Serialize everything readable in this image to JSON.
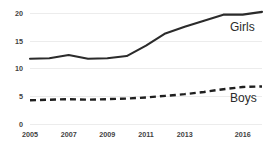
{
  "chart_data": {
    "type": "line",
    "title": "",
    "subtitle": "",
    "xlabel": "",
    "ylabel": "",
    "x": [
      2005,
      2006,
      2007,
      2008,
      2009,
      2010,
      2011,
      2012,
      2013,
      2014,
      2015,
      2016,
      2017
    ],
    "xlim": [
      2005,
      2017
    ],
    "ylim": [
      0,
      21
    ],
    "yticks": [
      0,
      5,
      10,
      15,
      20
    ],
    "ytick_labels": [
      "0",
      "5",
      "10",
      "15",
      "20"
    ],
    "xticks": [
      2005,
      2007,
      2009,
      2011,
      2013,
      2016
    ],
    "xtick_labels": [
      "2005",
      "2007",
      "2009",
      "2011",
      "2013",
      "2016"
    ],
    "grid": true,
    "grid_axis": "y",
    "legend_position": "inline-right",
    "series": [
      {
        "name": "Girls",
        "style": "solid",
        "color": "#2b2b2b",
        "label": "Girls",
        "values": [
          11.8,
          11.9,
          12.5,
          11.8,
          11.9,
          12.3,
          14.2,
          16.4,
          17.6,
          18.7,
          19.8,
          19.8,
          20.3
        ]
      },
      {
        "name": "Boys",
        "style": "dashed",
        "color": "#1f1f1f",
        "label": "Boys",
        "values": [
          4.3,
          4.4,
          4.5,
          4.4,
          4.5,
          4.6,
          4.8,
          5.1,
          5.4,
          5.8,
          6.3,
          6.7,
          6.8
        ]
      }
    ]
  },
  "colors": {
    "background": "#ffffff",
    "gridline": "#ececec",
    "tick_text": "#3f3f3f",
    "series_label_text": "#2b2b2b"
  }
}
